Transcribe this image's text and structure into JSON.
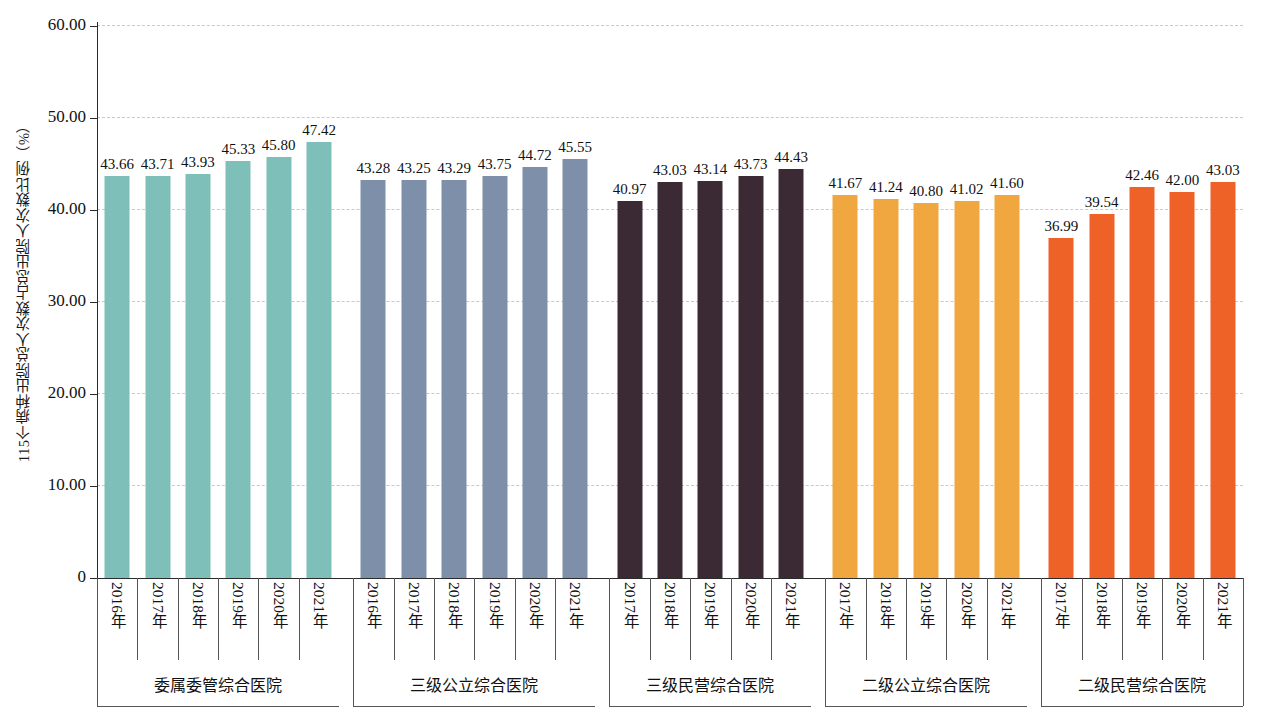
{
  "chart_data": {
    "type": "bar",
    "title": "",
    "xlabel": "",
    "ylabel": "115个病种出院总人次数占总出院人次数比例（%）",
    "ylim": [
      0,
      60
    ],
    "ytick_labels": [
      "0",
      "10.00",
      "20.00",
      "30.00",
      "40.00",
      "50.00",
      "60.00"
    ],
    "ytick_values": [
      0,
      10,
      20,
      30,
      40,
      50,
      60
    ],
    "grid": "horizontal-dashed",
    "legend": "none",
    "groups": [
      {
        "name": "委属委管综合医院",
        "color": "#7FBFBA",
        "categories": [
          "2016年",
          "2017年",
          "2018年",
          "2019年",
          "2020年",
          "2021年"
        ],
        "values": [
          43.66,
          43.71,
          43.93,
          45.33,
          45.8,
          47.42
        ],
        "labels": [
          "43.66",
          "43.71",
          "43.93",
          "45.33",
          "45.80",
          "47.42"
        ]
      },
      {
        "name": "三级公立综合医院",
        "color": "#7E8FAA",
        "categories": [
          "2016年",
          "2017年",
          "2018年",
          "2019年",
          "2020年",
          "2021年"
        ],
        "values": [
          43.28,
          43.25,
          43.29,
          43.75,
          44.72,
          45.55
        ],
        "labels": [
          "43.28",
          "43.25",
          "43.29",
          "43.75",
          "44.72",
          "45.55"
        ]
      },
      {
        "name": "三级民营综合医院",
        "color": "#3B2A33",
        "categories": [
          "2017年",
          "2018年",
          "2019年",
          "2020年",
          "2021年"
        ],
        "values": [
          40.97,
          43.03,
          43.14,
          43.73,
          44.43
        ],
        "labels": [
          "40.97",
          "43.03",
          "43.14",
          "43.73",
          "44.43"
        ]
      },
      {
        "name": "二级公立综合医院",
        "color": "#F0A73F",
        "categories": [
          "2017年",
          "2018年",
          "2019年",
          "2020年",
          "2021年"
        ],
        "values": [
          41.67,
          41.24,
          40.8,
          41.02,
          41.6
        ],
        "labels": [
          "41.67",
          "41.24",
          "40.80",
          "41.02",
          "41.60"
        ]
      },
      {
        "name": "二级民营综合医院",
        "color": "#EF6227",
        "categories": [
          "2017年",
          "2018年",
          "2019年",
          "2020年",
          "2021年"
        ],
        "values": [
          36.99,
          39.54,
          42.46,
          42.0,
          43.03
        ],
        "labels": [
          "36.99",
          "39.54",
          "42.46",
          "42.00",
          "43.03"
        ]
      }
    ]
  }
}
